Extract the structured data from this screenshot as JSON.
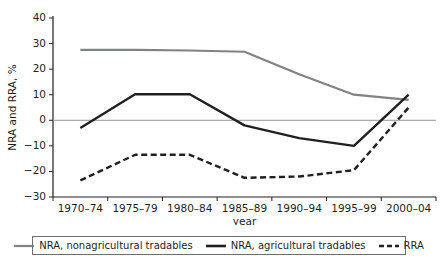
{
  "chart_data": {
    "type": "line",
    "title": "",
    "xlabel": "year",
    "ylabel": "NRA and RRA, %",
    "categories": [
      "1970–74",
      "1975–79",
      "1980–84",
      "1985–89",
      "1990–94",
      "1995–99",
      "2000–04"
    ],
    "ylim": [
      -30,
      40
    ],
    "yticks": [
      40,
      30,
      20,
      10,
      0,
      "−10",
      "−20",
      "−30"
    ],
    "ytick_values": [
      40,
      30,
      20,
      10,
      0,
      -10,
      -20,
      -30
    ],
    "grid": false,
    "zero_line": 0,
    "legend_position": "bottom",
    "series": [
      {
        "name": "NRA, nonagricultural tradables",
        "color": "#808285",
        "style": "solid",
        "values": [
          27.5,
          27.5,
          27.3,
          26.8,
          18.0,
          10.0,
          8.0
        ]
      },
      {
        "name": "NRA, agricultural tradables",
        "color": "#231f20",
        "style": "solid",
        "values": [
          -3.0,
          10.2,
          10.2,
          -2.0,
          -7.0,
          -10.0,
          10.0
        ]
      },
      {
        "name": "RRA",
        "color": "#231f20",
        "style": "dashed",
        "values": [
          -23.5,
          -13.5,
          -13.5,
          -22.5,
          -22.0,
          -19.5,
          5.0
        ]
      }
    ]
  },
  "axes": {
    "y_title": "NRA and RRA, %",
    "x_title": "year"
  },
  "legend": {
    "items": [
      {
        "label": "NRA, nonagricultural tradables",
        "icon": "line-solid-gray-icon"
      },
      {
        "label": "NRA, agricultural tradables",
        "icon": "line-solid-black-icon"
      },
      {
        "label": "RRA",
        "icon": "line-dashed-black-icon"
      }
    ]
  }
}
